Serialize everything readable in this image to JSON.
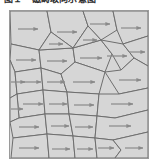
{
  "figure": {
    "caption": "图１　磁畴取向示意图",
    "title_visible_partial": true,
    "panel": {
      "background_color": "#d9d9d9",
      "frame_color": "#9a9a9a",
      "grain_fill_color": "#d6d6d6",
      "grain_boundary_color": "#6e6e6e",
      "arrow_color": "#8a8a8a",
      "outer_background_color": "#ffffff"
    }
  },
  "chart_data": {
    "type": "diagram",
    "title": "图１　磁畴取向示意图",
    "arrow_direction": "right",
    "arrow_count": 30,
    "grain_count": 30,
    "panel_bounds_px": {
      "x": 9,
      "y": 10,
      "width": 140,
      "height": 149
    },
    "grains": [
      {
        "id": "g01",
        "points": "1,1 38,1 42,22 30,40 2,34",
        "arrow": {
          "x": 9,
          "y": 19,
          "len": 20
        }
      },
      {
        "id": "g02",
        "points": "38,1 74,1 79,16 64,38 42,22",
        "arrow": {
          "x": 48,
          "y": 22,
          "len": 20
        }
      },
      {
        "id": "g03",
        "points": "74,1 104,1 108,20 92,30 79,16",
        "arrow": {
          "x": 81,
          "y": 14,
          "len": 20
        }
      },
      {
        "id": "g04",
        "points": "104,1 139,1 139,26 114,34 108,20",
        "arrow": {
          "x": 112,
          "y": 18,
          "len": 20
        }
      },
      {
        "id": "g05",
        "points": "2,34 30,40 32,58 6,62 1,50",
        "arrow": {
          "x": 7,
          "y": 50,
          "len": 20
        }
      },
      {
        "id": "g06",
        "points": "30,40 64,38 66,52 52,64 32,58",
        "arrow": {
          "x": 38,
          "y": 51,
          "len": 20
        }
      },
      {
        "id": "g07",
        "points": "64,38 92,30 103,44 96,62 66,52",
        "arrow": {
          "x": 71,
          "y": 48,
          "len": 22
        }
      },
      {
        "id": "g08",
        "points": "92,30 114,34 125,48 112,60 103,44",
        "arrow": {
          "x": 98,
          "y": 46,
          "len": 20
        }
      },
      {
        "id": "g09",
        "points": "114,34 139,26 139,56 125,48",
        "arrow": {
          "x": 120,
          "y": 42,
          "len": 16
        }
      },
      {
        "id": "g10",
        "points": "1,50 6,62 8,84 1,88",
        "arrow": {
          "x": 2,
          "y": 72,
          "len": 14
        }
      },
      {
        "id": "g11",
        "points": "6,62 32,58 34,80 8,84",
        "arrow": {
          "x": 12,
          "y": 72,
          "len": 20
        }
      },
      {
        "id": "g12",
        "points": "32,58 52,64 58,82 34,80",
        "arrow": {
          "x": 38,
          "y": 72,
          "len": 18
        }
      },
      {
        "id": "g13",
        "points": "52,64 66,52 96,62 90,84 58,82",
        "arrow": {
          "x": 64,
          "y": 72,
          "len": 22
        }
      },
      {
        "id": "g14",
        "points": "96,62 112,60 125,48 139,56 139,78 110,84",
        "arrow": {
          "x": 110,
          "y": 70,
          "len": 22
        }
      },
      {
        "id": "g15",
        "points": "8,84 34,80 36,104 10,108",
        "arrow": {
          "x": 14,
          "y": 94,
          "len": 20
        }
      },
      {
        "id": "g16",
        "points": "34,80 58,82 60,104 36,104",
        "arrow": {
          "x": 40,
          "y": 94,
          "len": 18
        }
      },
      {
        "id": "g17",
        "points": "58,82 90,84 88,106 60,104",
        "arrow": {
          "x": 65,
          "y": 95,
          "len": 20
        }
      },
      {
        "id": "g18",
        "points": "90,84 110,84 139,78 139,100 106,108 88,106",
        "arrow": {
          "x": 102,
          "y": 94,
          "len": 22
        }
      },
      {
        "id": "g19",
        "points": "1,88 8,84 10,108 1,112",
        "arrow": {
          "x": 2,
          "y": 99,
          "len": 12
        }
      },
      {
        "id": "g20",
        "points": "1,112 10,108 36,104 38,124 4,128",
        "arrow": {
          "x": 10,
          "y": 117,
          "len": 20
        }
      },
      {
        "id": "g21",
        "points": "36,104 60,104 64,126 38,124",
        "arrow": {
          "x": 42,
          "y": 116,
          "len": 18
        }
      },
      {
        "id": "g22",
        "points": "60,104 88,106 86,128 64,126",
        "arrow": {
          "x": 66,
          "y": 117,
          "len": 18
        }
      },
      {
        "id": "g23",
        "points": "88,106 106,108 139,100 139,122 104,130 86,128",
        "arrow": {
          "x": 100,
          "y": 116,
          "len": 22
        }
      },
      {
        "id": "g24",
        "points": "4,128 38,124 40,148 2,148",
        "arrow": {
          "x": 10,
          "y": 138,
          "len": 20
        }
      },
      {
        "id": "g25",
        "points": "38,124 64,126 66,148 40,148",
        "arrow": {
          "x": 43,
          "y": 139,
          "len": 18
        }
      },
      {
        "id": "g26",
        "points": "64,126 86,128 88,148 66,148",
        "arrow": {
          "x": 68,
          "y": 139,
          "len": 16
        }
      },
      {
        "id": "g27",
        "points": "86,128 104,130 112,140 106,148 88,148",
        "arrow": {
          "x": 89,
          "y": 138,
          "len": 16
        }
      },
      {
        "id": "g28",
        "points": "104,130 139,122 139,148 106,148 112,140",
        "arrow": {
          "x": 116,
          "y": 138,
          "len": 18
        }
      },
      {
        "id": "g29",
        "points": "42,22 64,38 30,40",
        "arrow": {
          "x": 40,
          "y": 34,
          "len": 14
        }
      },
      {
        "id": "g30",
        "points": "79,16 92,30 64,38",
        "arrow": {
          "x": 74,
          "y": 30,
          "len": 14
        }
      }
    ]
  }
}
